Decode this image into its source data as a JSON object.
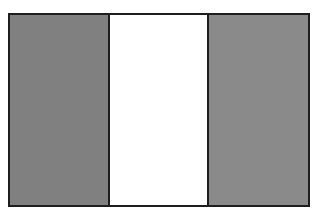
{
  "flag": {
    "orientation": "vertical-tricolor",
    "border_color": "#1e1e1e",
    "bands": [
      {
        "position": "left",
        "color": "#808080"
      },
      {
        "position": "middle",
        "color": "#ffffff"
      },
      {
        "position": "right",
        "color": "#8a8a8a"
      }
    ]
  }
}
